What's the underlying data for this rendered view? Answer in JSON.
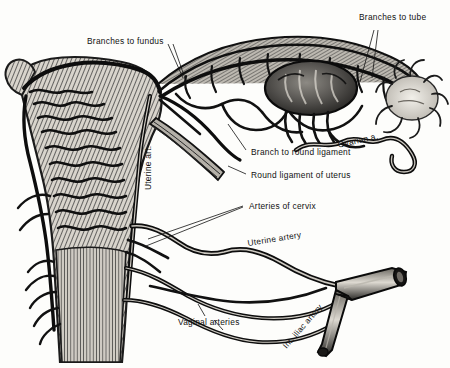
{
  "figure": {
    "type": "anatomical-engraving",
    "ink_color": "#1a1a1a",
    "paper_color": "#fdfdfb"
  },
  "labels": {
    "branches_to_fundus": "Branches to fundus",
    "branches_to_tube": "Branches to tube",
    "ovarian_artery": "Ovarian a.",
    "branch_to_round_ligament": "Branch to round ligament",
    "round_ligament_of_uterus": "Round ligament of uterus",
    "arteries_of_cervix": "Arteries of cervix",
    "uterine_artery": "Uterine artery",
    "uterine_art_vertical": "Uterine art.",
    "vaginal_arteries": "Vaginal arteries",
    "internal_iliac_artery": "Int. iliac artery"
  },
  "structures": [
    {
      "name": "uterus-body",
      "description": "Uterine corpus and cervix with dense tortuous arterial arcades over hatched myometrium"
    },
    {
      "name": "vagina",
      "description": "Vaginal wall below cervix with vertical striations"
    },
    {
      "name": "uterine-tube",
      "description": "Coiled uterine tube arching to the right with tubal branch arcade"
    },
    {
      "name": "ovary",
      "description": "Dark ovoid ovary with vessels entering at the hilum"
    },
    {
      "name": "fimbriae",
      "description": "Pale frilly fimbriated infundibulum at the lateral end of the tube"
    },
    {
      "name": "round-ligament",
      "description": "Striated band running inferolaterally from the uterine cornu"
    },
    {
      "name": "internal-iliac-artery",
      "description": "Thick cut trunk at lower right giving the uterine and vaginal arteries"
    }
  ]
}
